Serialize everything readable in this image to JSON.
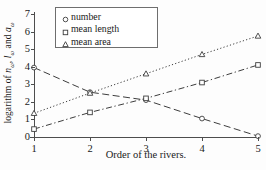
{
  "chart_data": {
    "type": "line",
    "title": "",
    "xlabel": "Order of the rivers.",
    "ylabel_parts": {
      "prefix": "logarithm of ",
      "sym1": "n",
      "sub1": "ω",
      "sep1": ", ",
      "sym2": "l",
      "sub2": "ω",
      "sep2": " and ",
      "sym3": "a",
      "sub3": "ω"
    },
    "ylabel": "logarithm of nω, lω and aω",
    "x": [
      1,
      2,
      3,
      4,
      5
    ],
    "xlim": [
      1,
      5
    ],
    "ylim": [
      0,
      7
    ],
    "xticks": [
      "1",
      "2",
      "3",
      "4",
      "5"
    ],
    "yticks": [
      "0",
      "1",
      "2",
      "3",
      "4",
      "5",
      "6",
      "7"
    ],
    "grid": false,
    "legend_position": "top-center",
    "series": [
      {
        "name": "number",
        "marker": "circle",
        "linestyle": "dashed",
        "color": "#3d3d3d",
        "values": [
          3.95,
          2.55,
          2.1,
          1.05,
          0.05
        ]
      },
      {
        "name": "mean length",
        "marker": "square",
        "linestyle": "dashdot",
        "color": "#3d3d3d",
        "values": [
          0.45,
          1.4,
          2.2,
          3.1,
          4.1
        ]
      },
      {
        "name": "mean area",
        "marker": "triangle",
        "linestyle": "dotted",
        "color": "#3d3d3d",
        "values": [
          1.35,
          2.5,
          3.6,
          4.7,
          5.75
        ]
      }
    ]
  },
  "legend": {
    "items": [
      {
        "label": "number",
        "marker": "circle-marker-icon"
      },
      {
        "label": "mean length",
        "marker": "square-marker-icon"
      },
      {
        "label": "mean area",
        "marker": "triangle-marker-icon"
      }
    ]
  }
}
